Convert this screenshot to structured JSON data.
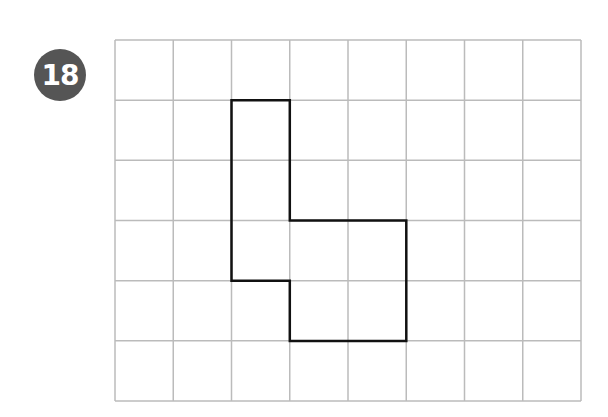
{
  "problem": {
    "number": "18",
    "badge_color": "#555555"
  },
  "grid": {
    "columns": 8,
    "rows": 6,
    "origin_x": 115,
    "origin_y": 40,
    "cell_width": 58.25,
    "cell_height": 60.17,
    "line_color": "#bbbbbb"
  },
  "shape": {
    "stroke_color": "#111111",
    "vertices": [
      [
        2,
        1
      ],
      [
        3,
        1
      ],
      [
        3,
        3
      ],
      [
        5,
        3
      ],
      [
        5,
        5
      ],
      [
        3,
        5
      ],
      [
        3,
        4
      ],
      [
        2,
        4
      ]
    ]
  }
}
